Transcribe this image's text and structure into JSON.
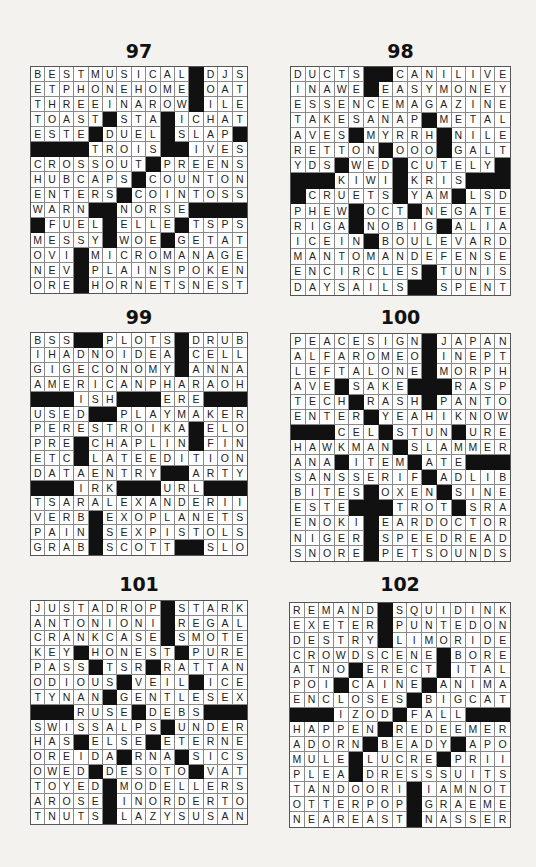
{
  "page": {
    "background": "#f4f2ee",
    "black_cell_color": "#111111"
  },
  "puzzles": [
    {
      "number": "97",
      "grid": [
        "BESTMUSICAL#DJS",
        "ETPHONEHOME#OAT",
        "THREEINAROW#ILE",
        "TOAST#STA#ICHAT",
        "ESTE#DUEL#SLAP#",
        "####TROIS##IVES",
        "CROSSOUT#PREENS",
        "HUBCAPS#COUNTON",
        "ENTERS#COINTOSS",
        "WARN##NORSE####",
        "#FUEL#ELLE#TSPS",
        "MESSY#WOE#GETAT",
        "OVI#MICROMANAGE",
        "NEV#PLAINSPOKEN",
        "ORE#HORNETSNEST"
      ]
    },
    {
      "number": "98",
      "grid": [
        "DUCTS##CANILIVE",
        "INAWE#EASYMONEY",
        "ESSENCEMAGAZINE",
        "TAKESANAP#METAL",
        "AVES#MYRRH#NILE",
        "RETTON#OOO#GALT",
        "YDS#WED#CUTELY#",
        "###KIWI#KRIS###",
        "#CRUETS#YAM#LSD",
        "PHEW#OCT#NEGATE",
        "RIGA#NOBIG#ALIA",
        "ICEIN#BOULEVARD",
        "MANTOMANDEFENSE",
        "ENCIRCLES#TUNIS",
        "DAYSAILS##SPENT"
      ]
    },
    {
      "number": "99",
      "grid": [
        "BSS##PLOTS#DRUB",
        "IHADNOIDEA#CELL",
        "GIGECONOMY#ANNA",
        "AMERICANPHARAOH",
        "###ISH###ERE###",
        "USED##PLAYMAKER",
        "PERESTROIKA#ELO",
        "PRE#CHAPLIN#FIN",
        "ETC#LATEEDITION",
        "DATAENTRY##ARTY",
        "###IRK###URL###",
        "TSARALEXANDERII",
        "VERB#EXOPLANETS",
        "PAIN#SEXPISTOLS",
        "GRAB#SCOTT##SLO"
      ]
    },
    {
      "number": "100",
      "grid": [
        "PEACESIGN#JAPAN",
        "ALFAROMEO#INEPT",
        "LEFTALONE#MORPH",
        "AVE#SAKE###RASP",
        "TECH#RASH#PANTO",
        "ENTER#YEAHIKNOW",
        "###CEL#STUN#URE",
        "HAWKMAN#SLAMMER",
        "ANA#ITEM#ATE###",
        "SANSSERIF#ADLIB",
        "BITES#OXEN#SINE",
        "ESTE###TROT#SRA",
        "ENOKI#EARDOCTOR",
        "NIGER#SPEEDREAD",
        "SNORE#PETSOUNDS"
      ]
    },
    {
      "number": "101",
      "grid": [
        "JUSTADROP#STARK",
        "ANTONIONI#REGAL",
        "CRANKCASE#SMOTE",
        "KEY#HONEST#PURE",
        "PASS#TSR#RATTAN",
        "ODIOUS#VEIL#ICE",
        "TYNAN#GENTLESEX",
        "###RUSE#DEBS###",
        "SWISSALPS#UNDER",
        "HAS#ELSE#ETERNE",
        "OREIDA#RNA#SICS",
        "OWED#DESOTO#VAT",
        "TOYED#MODELLERS",
        "AROSE#INORDERTO",
        "TNUTS#LAZYSUSAN"
      ]
    },
    {
      "number": "102",
      "grid": [
        "REMAND#SQUIDINK",
        "EXETER#PUNTEDON",
        "DESTRY#LIMORIDE",
        "CROWDSCENE#BORE",
        "ATNO#ERECT#ITAL",
        "POI#CAINE#ANIMA",
        "ENCLOSES#BIGCAT",
        "###IZOD#FALL###",
        "HAPPEN#REDEEMER",
        "ADORN#BEADY#APO",
        "MULE#LUCRE#PRII",
        "PLEA#DRESSSUITS",
        "TANDOORI#IAMNOT",
        "OTTERPOP#GRAEME",
        "NEAREAST#NASSER"
      ]
    }
  ]
}
